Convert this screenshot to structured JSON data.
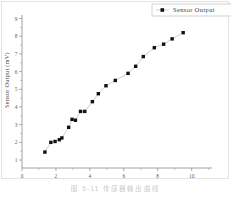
{
  "figure": {
    "caption": "图 5-11  传感器输出曲线",
    "background": "#ffffff"
  },
  "legend": {
    "label": "Sensor Output",
    "marker_color": "#111111",
    "position": "top-right",
    "clipped_at_right_edge": true
  },
  "chart_data": {
    "type": "scatter",
    "title": "",
    "subtitle": "",
    "xlabel": "",
    "ylabel": "Sensor Output (mV)",
    "xlim": [
      0,
      11.2
    ],
    "ylim": [
      0.55,
      9.2
    ],
    "xticks": [
      0,
      2,
      4,
      6,
      8,
      10
    ],
    "xticklabels": [
      "0",
      "2",
      "4",
      "6",
      "8",
      "10"
    ],
    "xminorticks": [
      1,
      3,
      5,
      7,
      9,
      11
    ],
    "yticks": [
      1,
      2,
      3,
      4,
      5,
      6,
      7,
      8,
      9
    ],
    "yticklabels": [
      "1",
      "2",
      "3",
      "4",
      "5",
      "6",
      "7",
      "8",
      "9"
    ],
    "grid": false,
    "marker": "square",
    "marker_color": "#111111",
    "line_color": "#b9b9b9",
    "connected": true,
    "series": [
      {
        "name": "Sensor Output",
        "x": [
          1.35,
          1.7,
          1.95,
          2.2,
          2.35,
          2.75,
          2.95,
          3.15,
          3.45,
          3.7,
          4.15,
          4.5,
          4.95,
          5.5,
          6.25,
          6.7,
          7.15,
          7.8,
          8.35,
          8.85,
          9.5
        ],
        "y": [
          1.45,
          2.0,
          2.05,
          2.15,
          2.25,
          2.85,
          3.3,
          3.25,
          3.75,
          3.75,
          4.3,
          4.75,
          5.2,
          5.5,
          5.9,
          6.3,
          6.85,
          7.35,
          7.55,
          7.85,
          8.2
        ]
      }
    ],
    "point_count": 21,
    "xaxis_tick_color": "#8a8a8a",
    "axis_color": "#8a8a8a"
  }
}
